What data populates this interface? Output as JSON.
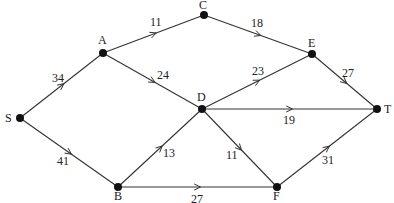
{
  "diagram": {
    "type": "directed-weighted-graph",
    "nodes": [
      {
        "id": "S",
        "label": "S",
        "x": 20,
        "y": 118,
        "lx": 5,
        "ly": 122
      },
      {
        "id": "A",
        "label": "A",
        "x": 103,
        "y": 53,
        "lx": 98,
        "ly": 44
      },
      {
        "id": "B",
        "label": "B",
        "x": 118,
        "y": 187,
        "lx": 114,
        "ly": 200
      },
      {
        "id": "C",
        "label": "C",
        "x": 204,
        "y": 15,
        "lx": 199,
        "ly": 9
      },
      {
        "id": "D",
        "label": "D",
        "x": 202,
        "y": 109,
        "lx": 197,
        "ly": 101
      },
      {
        "id": "E",
        "label": "E",
        "x": 312,
        "y": 54,
        "lx": 308,
        "ly": 47
      },
      {
        "id": "F",
        "label": "F",
        "x": 277,
        "y": 187,
        "lx": 273,
        "ly": 200
      },
      {
        "id": "T",
        "label": "T",
        "x": 377,
        "y": 109,
        "lx": 384,
        "ly": 113
      }
    ],
    "edges": [
      {
        "from": "S",
        "to": "A",
        "weight": "34",
        "lx": 52,
        "ly": 82
      },
      {
        "from": "S",
        "to": "B",
        "weight": "41",
        "lx": 57,
        "ly": 165
      },
      {
        "from": "A",
        "to": "C",
        "weight": "11",
        "lx": 150,
        "ly": 26
      },
      {
        "from": "A",
        "to": "D",
        "weight": "24",
        "lx": 157,
        "ly": 79
      },
      {
        "from": "C",
        "to": "E",
        "weight": "18",
        "lx": 251,
        "ly": 27
      },
      {
        "from": "D",
        "to": "E",
        "weight": "23",
        "lx": 252,
        "ly": 75
      },
      {
        "from": "E",
        "to": "T",
        "weight": "27",
        "lx": 342,
        "ly": 77
      },
      {
        "from": "D",
        "to": "T",
        "weight": "19",
        "lx": 283,
        "ly": 124
      },
      {
        "from": "B",
        "to": "D",
        "weight": "13",
        "lx": 163,
        "ly": 157
      },
      {
        "from": "D",
        "to": "F",
        "weight": "11",
        "lx": 226,
        "ly": 159
      },
      {
        "from": "B",
        "to": "F",
        "weight": "27",
        "lx": 191,
        "ly": 203
      },
      {
        "from": "F",
        "to": "T",
        "weight": "31",
        "lx": 322,
        "ly": 164
      }
    ]
  }
}
